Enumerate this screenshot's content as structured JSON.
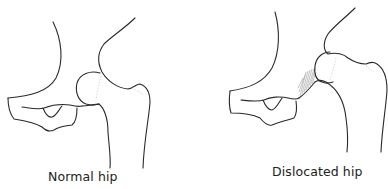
{
  "figure": {
    "panels": [
      {
        "id": "normal",
        "caption": "Normal hip"
      },
      {
        "id": "dislocated",
        "caption": "Dislocated hip"
      }
    ]
  },
  "colors": {
    "line": "#2a2a2a",
    "hatch": "#9a9a9a",
    "background": "#ffffff",
    "text": "#222222"
  }
}
